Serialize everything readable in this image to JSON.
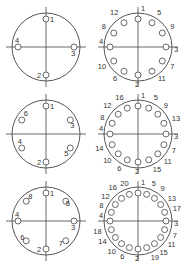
{
  "colors": {
    "stroke": "#444444",
    "text": "#333333",
    "background": "#ffffff"
  },
  "diagrams": [
    {
      "id": "pattern-4",
      "cx": 46,
      "cy": 47,
      "r": 34,
      "hole_r": 3,
      "hole_radius_pos": 28,
      "holes": [
        {
          "n": "1",
          "angle": 0,
          "lx": 4,
          "ly": 3
        },
        {
          "n": "3",
          "angle": 90,
          "lx": -3,
          "ly": 9
        },
        {
          "n": "2",
          "angle": 180,
          "lx": -9,
          "ly": 3
        },
        {
          "n": "4",
          "angle": 270,
          "lx": -3,
          "ly": -4
        }
      ]
    },
    {
      "id": "pattern-12",
      "cx": 138,
      "cy": 47,
      "r": 34,
      "hole_r": 3,
      "hole_radius_pos": 28,
      "holes": [
        {
          "n": "1",
          "angle": 0,
          "lx": 3,
          "ly": -8
        },
        {
          "n": "5",
          "angle": 30,
          "lx": 5,
          "ly": -8
        },
        {
          "n": "9",
          "angle": 60,
          "lx": 8,
          "ly": -4
        },
        {
          "n": "3",
          "angle": 90,
          "lx": 8,
          "ly": 5
        },
        {
          "n": "7",
          "angle": 120,
          "lx": 8,
          "ly": 8
        },
        {
          "n": "11",
          "angle": 150,
          "lx": 6,
          "ly": 10
        },
        {
          "n": "2",
          "angle": 180,
          "lx": -3,
          "ly": 12
        },
        {
          "n": "6",
          "angle": 210,
          "lx": -11,
          "ly": 10
        },
        {
          "n": "10",
          "angle": 240,
          "lx": -16,
          "ly": 8
        },
        {
          "n": "4",
          "angle": 270,
          "lx": -11,
          "ly": -3
        },
        {
          "n": "8",
          "angle": 300,
          "lx": -12,
          "ly": -4
        },
        {
          "n": "12",
          "angle": 330,
          "lx": -14,
          "ly": -8
        }
      ]
    },
    {
      "id": "pattern-6",
      "cx": 46,
      "cy": 134,
      "r": 34,
      "hole_r": 3,
      "hole_radius_pos": 28,
      "holes": [
        {
          "n": "1",
          "angle": 0,
          "lx": 4,
          "ly": 3
        },
        {
          "n": "3",
          "angle": 60,
          "lx": 0,
          "ly": 8
        },
        {
          "n": "5",
          "angle": 120,
          "lx": -6,
          "ly": 8
        },
        {
          "n": "2",
          "angle": 180,
          "lx": -9,
          "ly": 3
        },
        {
          "n": "4",
          "angle": 240,
          "lx": -4,
          "ly": -4
        },
        {
          "n": "6",
          "angle": 300,
          "lx": 2,
          "ly": -4
        }
      ]
    },
    {
      "id": "pattern-16",
      "cx": 138,
      "cy": 134,
      "r": 34,
      "hole_r": 3,
      "hole_radius_pos": 28,
      "holes": [
        {
          "n": "1",
          "angle": 0,
          "lx": 3,
          "ly": -8
        },
        {
          "n": "5",
          "angle": 22.5,
          "lx": 5,
          "ly": -8
        },
        {
          "n": "9",
          "angle": 45,
          "lx": 6,
          "ly": -6
        },
        {
          "n": "13",
          "angle": 67.5,
          "lx": 8,
          "ly": -2
        },
        {
          "n": "3",
          "angle": 90,
          "lx": 8,
          "ly": 5
        },
        {
          "n": "7",
          "angle": 112.5,
          "lx": 8,
          "ly": 8
        },
        {
          "n": "11",
          "angle": 135,
          "lx": 6,
          "ly": 10
        },
        {
          "n": "15",
          "angle": 157.5,
          "lx": 4,
          "ly": 12
        },
        {
          "n": "2",
          "angle": 180,
          "lx": -3,
          "ly": 12
        },
        {
          "n": "6",
          "angle": 202.5,
          "lx": -10,
          "ly": 11
        },
        {
          "n": "10",
          "angle": 225,
          "lx": -15,
          "ly": 9
        },
        {
          "n": "14",
          "angle": 247.5,
          "lx": -17,
          "ly": 6
        },
        {
          "n": "4",
          "angle": 270,
          "lx": -11,
          "ly": -3
        },
        {
          "n": "8",
          "angle": 292.5,
          "lx": -12,
          "ly": -3
        },
        {
          "n": "12",
          "angle": 315,
          "lx": -15,
          "ly": -6
        },
        {
          "n": "16",
          "angle": 337.5,
          "lx": -12,
          "ly": -8
        }
      ]
    },
    {
      "id": "pattern-8",
      "cx": 46,
      "cy": 221,
      "r": 34,
      "hole_r": 3,
      "hole_radius_pos": 28,
      "holes": [
        {
          "n": "1",
          "angle": 0,
          "lx": 4,
          "ly": 3
        },
        {
          "n": "5",
          "angle": 45,
          "lx": 0,
          "ly": 5
        },
        {
          "n": "3",
          "angle": 90,
          "lx": -3,
          "ly": 9
        },
        {
          "n": "7",
          "angle": 135,
          "lx": -7,
          "ly": 5
        },
        {
          "n": "2",
          "angle": 180,
          "lx": -9,
          "ly": 3
        },
        {
          "n": "6",
          "angle": 225,
          "lx": -6,
          "ly": -1
        },
        {
          "n": "4",
          "angle": 270,
          "lx": -3,
          "ly": -4
        },
        {
          "n": "8",
          "angle": 315,
          "lx": 2,
          "ly": -2
        }
      ]
    },
    {
      "id": "pattern-20",
      "cx": 138,
      "cy": 221,
      "r": 34,
      "hole_r": 3,
      "hole_radius_pos": 28,
      "holes": [
        {
          "n": "1",
          "angle": 0,
          "lx": 3,
          "ly": -8
        },
        {
          "n": "5",
          "angle": 18,
          "lx": 5,
          "ly": -8
        },
        {
          "n": "9",
          "angle": 36,
          "lx": 6,
          "ly": -7
        },
        {
          "n": "13",
          "angle": 54,
          "lx": 7,
          "ly": -4
        },
        {
          "n": "17",
          "angle": 72,
          "lx": 8,
          "ly": -1
        },
        {
          "n": "3",
          "angle": 90,
          "lx": 8,
          "ly": 5
        },
        {
          "n": "7",
          "angle": 108,
          "lx": 8,
          "ly": 8
        },
        {
          "n": "11",
          "angle": 126,
          "lx": 7,
          "ly": 10
        },
        {
          "n": "15",
          "angle": 144,
          "lx": 5,
          "ly": 11
        },
        {
          "n": "19",
          "angle": 162,
          "lx": 4,
          "ly": 12
        },
        {
          "n": "2",
          "angle": 180,
          "lx": -3,
          "ly": 12
        },
        {
          "n": "6",
          "angle": 198,
          "lx": -9,
          "ly": 11
        },
        {
          "n": "10",
          "angle": 216,
          "lx": -14,
          "ly": 10
        },
        {
          "n": "14",
          "angle": 234,
          "lx": -17,
          "ly": 7
        },
        {
          "n": "18",
          "angle": 252,
          "lx": -18,
          "ly": 4
        },
        {
          "n": "4",
          "angle": 270,
          "lx": -11,
          "ly": -3
        },
        {
          "n": "8",
          "angle": 288,
          "lx": -12,
          "ly": -4
        },
        {
          "n": "12",
          "angle": 306,
          "lx": -14,
          "ly": -6
        },
        {
          "n": "16",
          "angle": 324,
          "lx": -13,
          "ly": -8
        },
        {
          "n": "20",
          "angle": 342,
          "lx": -9,
          "ly": -8
        }
      ]
    }
  ]
}
